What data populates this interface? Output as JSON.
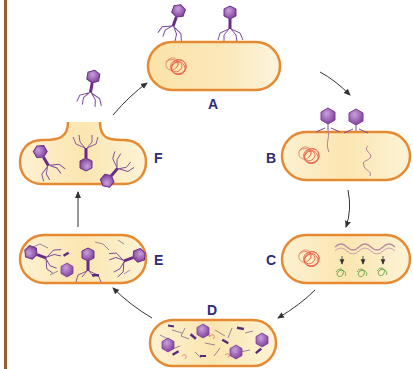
{
  "diagram": {
    "colors": {
      "cell_fill_light": "#fdf5dc",
      "cell_fill_dark": "#f7dc9a",
      "cell_border": "#e58a32",
      "phage": "#7a3b9a",
      "phage_head": "#9b59b6",
      "bacterial_dna": "#e8604a",
      "phage_dna": "#b07a9a",
      "protein": "#5aa040",
      "label": "#2e2a7a",
      "arrow": "#333333",
      "left_rule": "#9a5a32"
    },
    "stages": [
      {
        "id": "A",
        "label": "A",
        "description": "Phages approach bacterial cell"
      },
      {
        "id": "B",
        "label": "B",
        "description": "Phages attach and inject DNA"
      },
      {
        "id": "C",
        "label": "C",
        "description": "Phage DNA transcribed; proteins synthesized"
      },
      {
        "id": "D",
        "label": "D",
        "description": "Phage components assembled"
      },
      {
        "id": "E",
        "label": "E",
        "description": "Complete phages assembled"
      },
      {
        "id": "F",
        "label": "F",
        "description": "Cell lyses, releasing phages"
      }
    ],
    "cycle_order": [
      "A",
      "B",
      "C",
      "D",
      "E",
      "F",
      "A"
    ]
  }
}
